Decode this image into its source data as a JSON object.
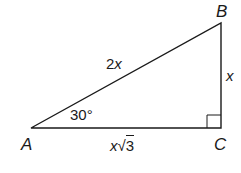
{
  "diagram": {
    "type": "right-triangle",
    "stroke_color": "#1a1a1a",
    "vertices": {
      "A": {
        "label": "A",
        "x": 31,
        "y": 128
      },
      "B": {
        "label": "B",
        "x": 221,
        "y": 23
      },
      "C": {
        "label": "C",
        "x": 221,
        "y": 128
      }
    },
    "sides": {
      "AB": {
        "label_coef": "2",
        "label_var": "x",
        "name": "hypotenuse"
      },
      "BC": {
        "label_var": "x",
        "name": "short leg"
      },
      "AC": {
        "label_var": "x",
        "label_radical": "√",
        "label_radicand": "3",
        "name": "long leg"
      }
    },
    "angles": {
      "A": {
        "label": "30°"
      },
      "C": {
        "marker": "right-angle"
      }
    }
  }
}
